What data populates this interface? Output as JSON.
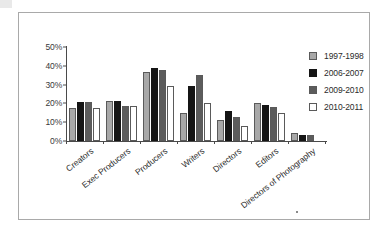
{
  "chart_data": {
    "type": "bar",
    "title": "",
    "xlabel": "",
    "ylabel": "",
    "ylim": [
      0,
      50
    ],
    "ytick_labels": [
      "50%",
      "40%",
      "30%",
      "20%",
      "10%",
      "0%"
    ],
    "ytick_values": [
      50,
      40,
      30,
      20,
      10,
      0
    ],
    "grid": false,
    "legend_position": "right",
    "categories": [
      "Creators",
      "Exec Producers",
      "Producers",
      "Writers",
      "Directors",
      "Editors",
      "Directors of Photography"
    ],
    "series": [
      {
        "name": "1997-1998",
        "color": "#a8a8a8",
        "values": [
          17.5,
          21.5,
          36.5,
          15.0,
          11.0,
          20.0,
          4.0
        ]
      },
      {
        "name": "2006-2007",
        "color": "#151515",
        "values": [
          20.5,
          21.5,
          39.0,
          29.0,
          16.0,
          19.0,
          3.0
        ]
      },
      {
        "name": "2009-2010",
        "color": "#5c5c5c",
        "values": [
          20.5,
          18.7,
          38.0,
          35.0,
          13.0,
          18.0,
          3.0
        ]
      },
      {
        "name": "2010-2011",
        "color": "#ffffff",
        "values": [
          17.5,
          18.7,
          29.0,
          20.0,
          8.0,
          15.0,
          0.0
        ]
      }
    ]
  },
  "legend": {
    "items": [
      {
        "label": "1997-1998"
      },
      {
        "label": "2006-2007"
      },
      {
        "label": "2009-2010"
      },
      {
        "label": "2010-2011"
      }
    ]
  }
}
